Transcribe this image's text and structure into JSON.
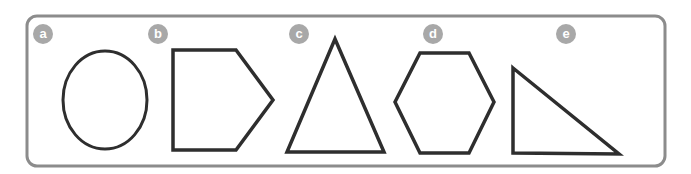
{
  "diagram": {
    "frame_color": "#8c8c8c",
    "shape_stroke": "#2e2e2e",
    "badge_color": "#a8a8a8",
    "shapes": [
      {
        "label": "a",
        "name": "oval"
      },
      {
        "label": "b",
        "name": "pentagon"
      },
      {
        "label": "c",
        "name": "isosceles-triangle"
      },
      {
        "label": "d",
        "name": "hexagon"
      },
      {
        "label": "e",
        "name": "right-triangle"
      }
    ]
  }
}
